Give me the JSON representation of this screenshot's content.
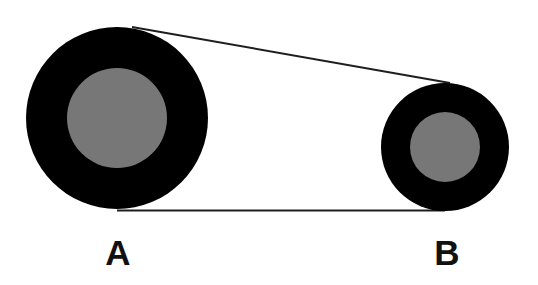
{
  "diagram": {
    "type": "belt-pulley",
    "colors": {
      "background": "#ffffff",
      "pulley_outer": "#000000",
      "pulley_inner": "#777777",
      "belt": "#1e1e1e",
      "label": "#111111"
    },
    "pulleys": [
      {
        "id": "A",
        "label": "A",
        "cx": 117,
        "cy": 118,
        "outer_r": 91,
        "inner_r": 50,
        "label_x": 118,
        "label_y": 252
      },
      {
        "id": "B",
        "label": "B",
        "cx": 445,
        "cy": 147,
        "outer_r": 64,
        "inner_r": 35,
        "label_x": 447,
        "label_y": 252
      }
    ],
    "belt": {
      "top_segment": {
        "x1": 132,
        "y1": 27,
        "x2": 450,
        "y2": 83
      },
      "bottom_segment": {
        "x1": 117,
        "y1": 210.5,
        "x2": 445,
        "y2": 210.5
      },
      "stroke_width": 2
    }
  }
}
